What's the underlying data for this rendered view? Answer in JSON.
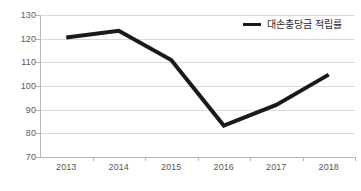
{
  "chart_data": {
    "type": "line",
    "title": "",
    "xlabel": "",
    "ylabel": "",
    "categories": [
      "2013",
      "2014",
      "2015",
      "2016",
      "2017",
      "2018"
    ],
    "series": [
      {
        "name": "대손충당금 적립률",
        "values": [
          120.5,
          123.3,
          111.0,
          83.3,
          92.0,
          104.8
        ],
        "color": "#1a1a1a"
      }
    ],
    "ylim": [
      70,
      130
    ],
    "yticks": [
      70,
      80,
      90,
      100,
      110,
      120,
      130
    ],
    "ytick_labels": [
      "70",
      "80",
      "90",
      "100",
      "110",
      "120",
      "130"
    ],
    "grid": true,
    "grid_color": "#d9d9d9",
    "legend_position": "top-right"
  },
  "legend": {
    "label": "대손충당금 적립률"
  },
  "axes": {
    "y_labels": [
      "130",
      "120",
      "110",
      "100",
      "90",
      "80",
      "70"
    ],
    "x_labels": [
      "2013",
      "2014",
      "2015",
      "2016",
      "2017",
      "2018"
    ]
  }
}
